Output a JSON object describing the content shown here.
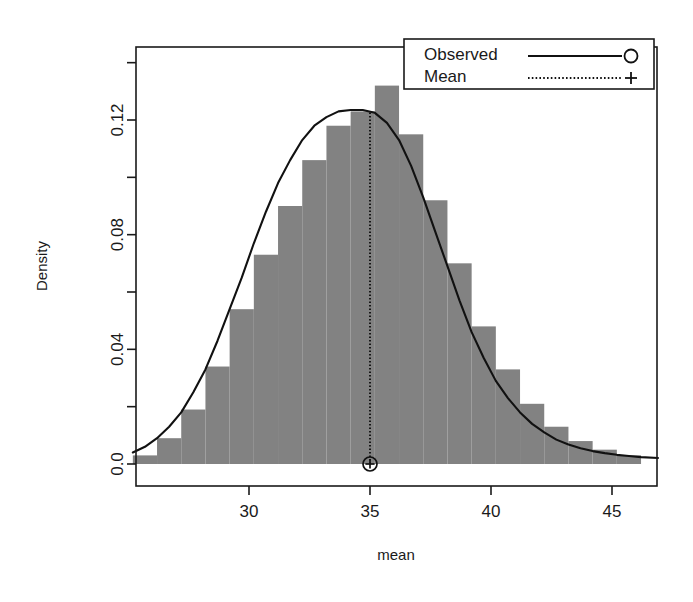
{
  "chart_data": {
    "type": "bar",
    "title": "",
    "subtitle": "",
    "xlabel": "mean",
    "ylabel": "Density",
    "xlim": [
      25.2,
      46.9
    ],
    "ylim": [
      0.0,
      0.134
    ],
    "grid": false,
    "bin_width": 1,
    "bin_starts": [
      25.2,
      26.2,
      27.2,
      28.2,
      29.2,
      30.2,
      31.2,
      32.2,
      33.2,
      34.2,
      35.2,
      36.2,
      37.2,
      38.2,
      39.2,
      40.2,
      41.2,
      42.2,
      43.2,
      44.2,
      45.2
    ],
    "bin_centers": [
      25.7,
      26.7,
      27.7,
      28.7,
      29.7,
      30.7,
      31.7,
      32.7,
      33.7,
      34.7,
      35.7,
      36.7,
      37.7,
      38.7,
      39.7,
      40.7,
      41.7,
      42.7,
      43.7,
      44.7,
      45.7
    ],
    "values": [
      0.003,
      0.009,
      0.019,
      0.034,
      0.054,
      0.073,
      0.09,
      0.106,
      0.118,
      0.123,
      0.132,
      0.115,
      0.092,
      0.07,
      0.048,
      0.033,
      0.021,
      0.013,
      0.008,
      0.005,
      0.003
    ],
    "xticks": [
      30,
      35,
      40,
      45
    ],
    "xtick_labels": [
      "30",
      "35",
      "40",
      "45"
    ],
    "yticks": [
      0.0,
      0.04,
      0.08,
      0.12
    ],
    "ytick_labels": [
      "0.0",
      "0.04",
      "0.08",
      "0.12"
    ],
    "yminor_ticks": [
      0.02,
      0.06,
      0.1,
      0.14
    ],
    "density_curve": {
      "name": "Observed",
      "x": [
        25.2,
        25.7,
        26.2,
        26.7,
        27.2,
        27.7,
        28.2,
        28.7,
        29.2,
        29.7,
        30.2,
        30.7,
        31.2,
        31.7,
        32.2,
        32.7,
        33.2,
        33.7,
        34.2,
        34.7,
        35.2,
        35.7,
        36.2,
        36.7,
        37.2,
        37.7,
        38.2,
        38.7,
        39.2,
        39.7,
        40.2,
        40.7,
        41.2,
        41.7,
        42.2,
        42.7,
        43.2,
        43.7,
        44.2,
        44.7,
        45.2,
        45.7,
        46.2,
        46.9
      ],
      "y": [
        0.004,
        0.006,
        0.009,
        0.013,
        0.018,
        0.025,
        0.033,
        0.043,
        0.054,
        0.065,
        0.077,
        0.088,
        0.098,
        0.106,
        0.113,
        0.118,
        0.121,
        0.123,
        0.1235,
        0.1235,
        0.1225,
        0.119,
        0.113,
        0.104,
        0.093,
        0.081,
        0.069,
        0.057,
        0.046,
        0.037,
        0.029,
        0.023,
        0.018,
        0.014,
        0.011,
        0.0085,
        0.0068,
        0.0055,
        0.0045,
        0.0038,
        0.0032,
        0.0028,
        0.0024,
        0.0021
      ]
    },
    "mean_marker": {
      "name": "Mean",
      "x": 35.0,
      "y_bottom": 0.0,
      "y_top": 0.1226
    },
    "legend": {
      "position": "top-right",
      "entries": [
        {
          "label": "Observed",
          "line_style": "solid",
          "marker": "circle"
        },
        {
          "label": "Mean",
          "line_style": "dotted",
          "marker": "plus"
        }
      ]
    },
    "colors": {
      "bar_fill": "#828282",
      "curve": "#111111",
      "axis": "#1a1a1a",
      "background": "#ffffff"
    }
  }
}
